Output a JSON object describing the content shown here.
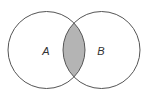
{
  "diagram": {
    "type": "venn",
    "sets": [
      {
        "label": "A",
        "cx": 46.5,
        "cy": 50,
        "r": 38.5
      },
      {
        "label": "B",
        "cx": 101.5,
        "cy": 50,
        "r": 38.5
      }
    ],
    "highlighted_region": "A ∩ B",
    "colors": {
      "stroke": "#555555",
      "intersection_fill": "#b4b4b4",
      "background": "#ffffff"
    }
  }
}
